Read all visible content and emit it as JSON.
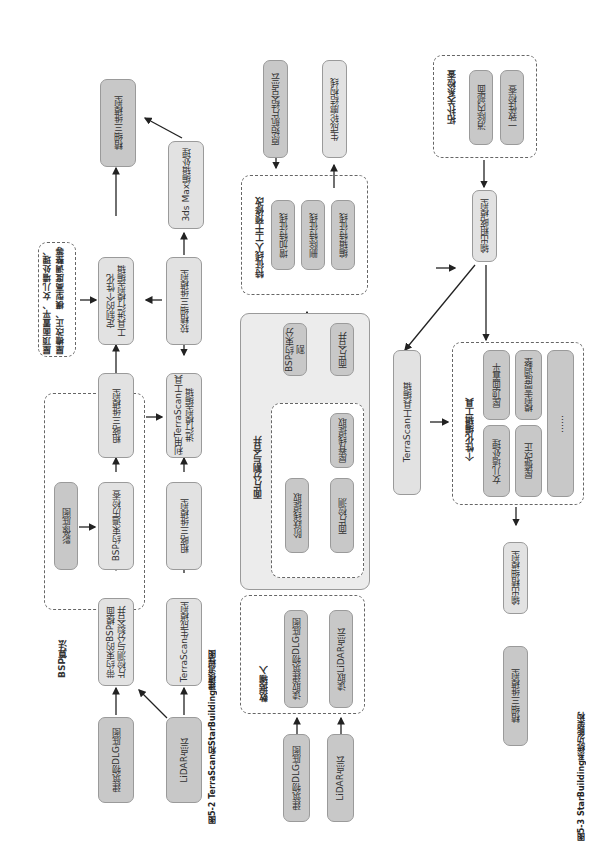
{
  "page_number": "",
  "figure_5_2": {
    "caption": "图5-2   TerraScan和StarBuilding建模流程图",
    "bsp_group_label": "BSP算法",
    "note_text": "屋顶面置平、女儿墙处理、\n屋檐改正、模型高度调整等",
    "nodes": {
      "dlg_base": "建筑物DLG底图",
      "lidar": "LiDAR点云",
      "bsp_detect": "带约束的BSP模面\n片检测与分裂合并",
      "image_base": "影像底图",
      "bsp_check": "BSP约束遍历检查",
      "rough_model_a": "粗略三维模型",
      "custom_edit": "定制的个性化\n工具进行模型编辑",
      "fine_model": "精细三维模型",
      "terrascan_gen": "TerraScan生成模型",
      "rough_model_b": "粗略三维模型",
      "terrascan_edit": "利用TerraScan工具\n进行模型编辑",
      "finer_model": "较精细三维模型",
      "max_process": "3ds Max编辑处理"
    }
  },
  "figure_5_3": {
    "caption": "图5-3   StarBuilding系统功能架构",
    "groups": {
      "data_input": "数据输入",
      "facet_split": "面片分割与合并",
      "feature_edit": "特征线人工干预修改",
      "topology": "拓扑关系检查",
      "personal_tools": "个性化编辑工具"
    },
    "nodes": {
      "dlg_base": "建筑物DLG底图",
      "lidar": "LiDAR点云",
      "read_dlg": "读取建筑物DLG底图",
      "read_lidar": "读取LiDAR点云",
      "step_line": "阶跃线提取",
      "facet_detect": "面片检测",
      "ridge_line": "屋脊线提取",
      "bsp_split": "BSP约束分割",
      "facet_merge": "面片合并",
      "add_feature": "增加特征线",
      "del_feature": "删除特征线",
      "edit_feature": "编辑特征线",
      "orig_cloud": "原始航片结合点云",
      "gen_contour": "生成轮廓结构线",
      "remove_inner": "消除内部面",
      "consistency": "一致性检查",
      "output_rough": "输出粗略模型",
      "terrascan_edit": "TerraScan工具编辑",
      "parapet": "女儿墙处理",
      "roof_flat": "屋顶面置平",
      "eave_fix": "屋檐改正",
      "height_adjust": "模型高度调整",
      "more": "……",
      "output_fine": "输出精细模型",
      "fine_model": "精细三维模型"
    }
  },
  "colors": {
    "node_light": "#e2e2e2",
    "node_dark": "#c8c8c8",
    "border": "#9a9a9a",
    "arrow": "#222222"
  }
}
